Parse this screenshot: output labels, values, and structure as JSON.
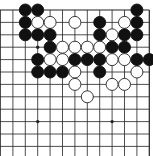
{
  "board": {
    "description": "Go board diagram (partial, top edge visible)",
    "cols": 13,
    "rows": 12,
    "origin_x": 0.5,
    "origin_y": 10,
    "spacing": 12.4,
    "stone_radius": 6,
    "colors": {
      "background": "#ffffff",
      "line": "#222222",
      "black_stone": "#111111",
      "white_stone": "#ffffff",
      "white_stone_outline": "#222222"
    },
    "edges": {
      "top": true,
      "right": true,
      "left": false,
      "bottom": false
    },
    "star_points": [
      {
        "col": 3,
        "row": 3
      },
      {
        "col": 3,
        "row": 9
      },
      {
        "col": 9,
        "row": 9
      }
    ],
    "stones": [
      {
        "color": "black",
        "col": 2,
        "row": 0
      },
      {
        "color": "black",
        "col": 3,
        "row": 0
      },
      {
        "color": "black",
        "col": 11,
        "row": 0
      },
      {
        "color": "black",
        "col": 2,
        "row": 1
      },
      {
        "color": "white",
        "col": 3,
        "row": 1
      },
      {
        "color": "white",
        "col": 4,
        "row": 1
      },
      {
        "color": "white",
        "col": 6,
        "row": 1
      },
      {
        "color": "black",
        "col": 8,
        "row": 1
      },
      {
        "color": "white",
        "col": 10,
        "row": 1
      },
      {
        "color": "black",
        "col": 11,
        "row": 1
      },
      {
        "color": "black",
        "col": 2,
        "row": 2
      },
      {
        "color": "black",
        "col": 3,
        "row": 2
      },
      {
        "color": "black",
        "col": 4,
        "row": 2
      },
      {
        "color": "black",
        "col": 8,
        "row": 2
      },
      {
        "color": "white",
        "col": 9,
        "row": 2
      },
      {
        "color": "black",
        "col": 10,
        "row": 2
      },
      {
        "color": "black",
        "col": 11,
        "row": 2
      },
      {
        "color": "black",
        "col": 4,
        "row": 3
      },
      {
        "color": "white",
        "col": 5,
        "row": 3
      },
      {
        "color": "white",
        "col": 6,
        "row": 3
      },
      {
        "color": "white",
        "col": 7,
        "row": 3
      },
      {
        "color": "white",
        "col": 8,
        "row": 3
      },
      {
        "color": "black",
        "col": 9,
        "row": 3
      },
      {
        "color": "black",
        "col": 10,
        "row": 3
      },
      {
        "color": "black",
        "col": 3,
        "row": 4
      },
      {
        "color": "white",
        "col": 4,
        "row": 4
      },
      {
        "color": "white",
        "col": 5,
        "row": 4
      },
      {
        "color": "black",
        "col": 6,
        "row": 4
      },
      {
        "color": "black",
        "col": 7,
        "row": 4
      },
      {
        "color": "black",
        "col": 8,
        "row": 4
      },
      {
        "color": "white",
        "col": 9,
        "row": 4
      },
      {
        "color": "white",
        "col": 10,
        "row": 4
      },
      {
        "color": "black",
        "col": 11,
        "row": 4
      },
      {
        "color": "black",
        "col": 12,
        "row": 4
      },
      {
        "color": "black",
        "col": 3,
        "row": 5
      },
      {
        "color": "black",
        "col": 4,
        "row": 5
      },
      {
        "color": "black",
        "col": 5,
        "row": 5
      },
      {
        "color": "white",
        "col": 6,
        "row": 5
      },
      {
        "color": "black",
        "col": 8,
        "row": 5
      },
      {
        "color": "white",
        "col": 11,
        "row": 5
      },
      {
        "color": "white",
        "col": 6,
        "row": 6
      },
      {
        "color": "white",
        "col": 9,
        "row": 6
      },
      {
        "color": "white",
        "col": 10,
        "row": 6
      },
      {
        "color": "white",
        "col": 7,
        "row": 7
      }
    ]
  }
}
